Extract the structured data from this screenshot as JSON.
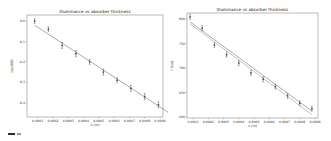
{
  "chart_data": [
    {
      "type": "scatter",
      "title": "Illuminance vs absorber thickness",
      "xlabel": "x (m)",
      "ylabel": "log(I/I0)",
      "xlim": [
        3e-05,
        0.00092
      ],
      "ylim": [
        -0.47,
        0.03
      ],
      "x_ticks": [
        "0.0000",
        "0.0001",
        "0.0002",
        "0.0003",
        "0.0004",
        "0.0005",
        "0.0006",
        "0.0007",
        "0.0008",
        "0.0009"
      ],
      "y_ticks": [
        "0.0",
        "-0.1",
        "-0.2",
        "-0.3",
        "-0.4"
      ],
      "grid": false,
      "series": [
        {
          "name": "data",
          "style": "errorbar",
          "x": [
            8e-05,
            0.00017,
            0.00026,
            0.00035,
            0.00044,
            0.00053,
            0.00062,
            0.00071,
            0.0008,
            0.00089,
            0.00098
          ],
          "y": [
            0.0,
            -0.04,
            -0.12,
            -0.16,
            -0.2,
            -0.25,
            -0.29,
            -0.33,
            -0.37,
            -0.41,
            -0.45
          ],
          "yerr": [
            0.012,
            0.012,
            0.015,
            0.015,
            0.012,
            0.015,
            0.012,
            0.015,
            0.015,
            0.015,
            0.015
          ]
        },
        {
          "name": "fit",
          "style": "line",
          "x": [
            8e-05,
            0.00098
          ],
          "y": [
            -0.02,
            -0.46
          ]
        }
      ]
    },
    {
      "type": "scatter",
      "title": "Illuminance vs absorber thickness",
      "xlabel": "x (m)",
      "ylabel": "I (lux)",
      "xlim": [
        6e-05,
        0.00092
      ],
      "ylim": [
        598,
        812
      ],
      "x_ticks": [
        "0.0001",
        "0.0002",
        "0.0003",
        "0.0004",
        "0.0005",
        "0.0006",
        "0.0007",
        "0.0008",
        "0.0009"
      ],
      "y_ticks": [
        "800",
        "750",
        "700",
        "650",
        "600"
      ],
      "grid": false,
      "series": [
        {
          "name": "data",
          "style": "errorbar",
          "x": [
            8e-05,
            0.00016,
            0.00024,
            0.00032,
            0.0004,
            0.00048,
            0.00056,
            0.00064,
            0.00072,
            0.0008,
            0.00088
          ],
          "y": [
            804,
            781,
            747,
            727,
            710,
            690,
            677,
            662,
            643,
            628,
            617
          ],
          "yerr": [
            5,
            5,
            5,
            5,
            5,
            5,
            5,
            5,
            5,
            5,
            5
          ]
        },
        {
          "name": "fit-exponential",
          "style": "line",
          "x": [
            8e-05,
            0.00088
          ],
          "y": [
            794,
            612
          ]
        },
        {
          "name": "fit-linear",
          "style": "line",
          "x": [
            8e-05,
            0.00088
          ],
          "y": [
            790,
            605
          ]
        }
      ]
    }
  ]
}
